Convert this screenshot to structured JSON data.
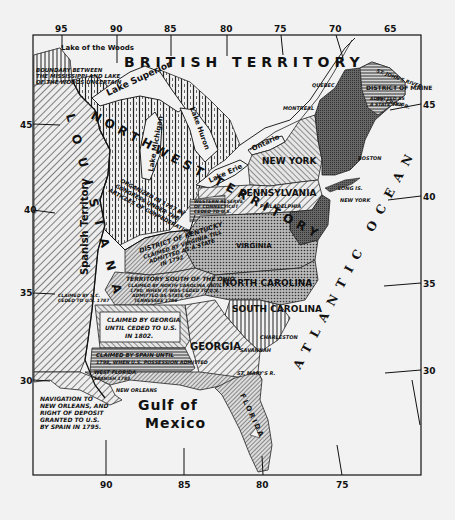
{
  "map": {
    "title": "",
    "colors": {
      "background": "#f2f2f2",
      "ink": "#111111",
      "land_dark": "#555555",
      "land_mid": "#8a8a8a",
      "land_light": "#c4c4c4",
      "water": "#f2f2f2"
    },
    "longitude_ticks_top": [
      "95",
      "90",
      "85",
      "80",
      "75",
      "70",
      "65"
    ],
    "longitude_ticks_bottom": [
      "90",
      "85",
      "80",
      "75"
    ],
    "latitude_ticks_left": [
      "45",
      "40",
      "35",
      "30"
    ],
    "latitude_ticks_right": [
      "45",
      "40",
      "35",
      "30"
    ],
    "regions": {
      "british_territory": "BRITISH TERRITORY",
      "northwest_territory": "NORTHWEST TERRITORY",
      "louisiana": "LOUISIANA",
      "spanish_territory": "Spanish Territory",
      "new_york": "NEW YORK",
      "pennsylvania": "PENNSYLVANIA",
      "virginia": "VIRGINIA",
      "north_carolina": "NORTH CAROLINA",
      "south_carolina": "SOUTH CAROLINA",
      "georgia": "GEORGIA",
      "district_of_maine": "DISTRICT OF MAINE",
      "florida": "FLORIDA"
    },
    "lakes": {
      "lake_of_the_woods": "Lake of the Woods",
      "lake_superior": "Lake Superior",
      "lake_michigan": "Lake Michigan",
      "lake_huron": "Lake Huron",
      "lake_erie": "Lake Erie",
      "lake_ontario": "Ontario"
    },
    "water_bodies": {
      "atlantic": "ATLANTIC OCEAN",
      "gulf_line1": "Gulf of",
      "gulf_line2": "Mexico"
    },
    "cities": {
      "quebec": "QUEBEC",
      "montreal": "MONTREAL",
      "boston": "BOSTON",
      "new_york": "NEW YORK",
      "long_is": "LONG IS.",
      "philadelphia": "PHILADELPHIA",
      "charleston": "CHARLESTON",
      "savannah": "SAVANNAH",
      "st_marys": "ST. MARY'S R.",
      "new_orleans": "NEW ORLEANS"
    },
    "rivers": {
      "st_johns": "ST. JOHN'S RIVER",
      "st_croix": "ST. CROIX R.",
      "ohio": "OHIO RIVER",
      "mississippi": "MISSISSIPPI"
    },
    "annotations": {
      "boundary_line1": "BOUNDARY BETWEEN",
      "boundary_line2": "THE MISSISSIPPI AND LAKE",
      "boundary_line3": "OF THE WOODS UNCERTAIN",
      "nw_org_line1": "ORGANIZED IN 1787 BY",
      "nw_org_line2": "CONGRESS UNDER THE",
      "nw_org_line3": "ARTICLES OF CONFEDERATION",
      "western_reserve_line1": "WESTERN RESERVE",
      "western_reserve_line2": "OF CONNECTICUT",
      "western_reserve_line3": "CEDED TO U.S.",
      "maine_line1": "ADMITTED AS",
      "maine_line2": "A STATE 1820",
      "vermont": "ADMITTED AS A STATE 1791",
      "kentucky_title": "DISTRICT OF KENTUCKY",
      "kentucky_line1": "CLAIMED BY VIRGINIA TILL",
      "kentucky_line2": "ADMITTED AS A STATE",
      "kentucky_line3": "IN 1792",
      "sw_title": "TERRITORY SOUTH OF THE OHIO",
      "sw_line1": "CLAIMED BY NORTH CAROLINA UNTIL",
      "sw_line2": "1790, WHEN IT WAS CEDED TO U.S.",
      "sw_line3": "ADMITTED AS STATE OF",
      "sw_line4": "TENNESSEE 1796",
      "sc_claim_line1": "CLAIMED BY S.C.",
      "sc_claim_line2": "CEDED TO U.S. 1787",
      "georgia_claim_line1": "CLAIMED BY GEORGIA",
      "georgia_claim_line2": "UNTIL CEDED TO U.S.",
      "georgia_claim_line3": "IN 1802.",
      "spain_claim_line1": "CLAIMED BY SPAIN UNTIL",
      "spain_claim_line2": "1798, WHEN U.S. POSSESSION ADMITTED",
      "west_florida_line1": "WEST FLORIDA",
      "west_florida_line2": "SPANISH 1783",
      "florida_sub": "SPANISH 1783",
      "nav_line1": "NAVIGATION TO",
      "nav_line2": "NEW ORLEANS, AND",
      "nav_line3": "RIGHT OF DEPOSIT",
      "nav_line4": "GRANTED TO U.S.",
      "nav_line5": "BY SPAIN IN 1795."
    }
  }
}
